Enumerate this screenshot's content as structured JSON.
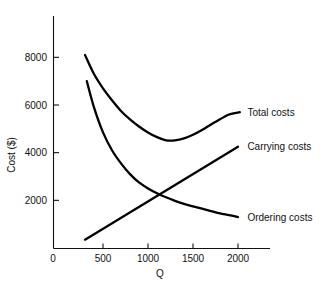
{
  "chart_data": {
    "type": "line",
    "title": "",
    "xlabel": "Q",
    "ylabel": "Cost ($)",
    "xlim": [
      0,
      2100
    ],
    "ylim": [
      0,
      9000
    ],
    "grid": false,
    "legend_position": "right-inline-labels",
    "x_ticks": [
      0,
      500,
      1000,
      1500,
      2000
    ],
    "x_tick_labels": [
      "0",
      "500",
      "1000",
      "1500",
      "2000"
    ],
    "y_ticks": [
      2000,
      4000,
      6000,
      8000
    ],
    "y_tick_labels": [
      "2000",
      "4000",
      "6000",
      "8000"
    ],
    "series": [
      {
        "name": "Total costs",
        "label": "Total costs",
        "x": [
          300,
          400,
          500,
          600,
          700,
          800,
          900,
          1000,
          1100,
          1200,
          1300,
          1400,
          1500,
          1600,
          1700,
          1800,
          1900,
          2020
        ],
        "values": [
          8100,
          7300,
          6700,
          6200,
          5750,
          5400,
          5100,
          4850,
          4650,
          4520,
          4520,
          4600,
          4750,
          4950,
          5180,
          5400,
          5600,
          5700
        ]
      },
      {
        "name": "Carrying costs",
        "label": "Carrying costs",
        "x": [
          300,
          2000
        ],
        "values": [
          350,
          4250
        ]
      },
      {
        "name": "Ordering costs",
        "label": "Ordering costs",
        "x": [
          320,
          400,
          500,
          600,
          700,
          800,
          900,
          1000,
          1100,
          1200,
          1300,
          1400,
          1500,
          1600,
          1700,
          1800,
          1900,
          2000
        ],
        "values": [
          7000,
          5900,
          4850,
          4100,
          3550,
          3100,
          2750,
          2500,
          2300,
          2130,
          1980,
          1850,
          1750,
          1650,
          1550,
          1450,
          1380,
          1300
        ]
      }
    ],
    "annotations": [
      {
        "text": "Total costs",
        "x": 2060,
        "y": 5700
      },
      {
        "text": "Carrying costs",
        "x": 2060,
        "y": 4250
      },
      {
        "text": "Ordering costs",
        "x": 2060,
        "y": 1300
      }
    ]
  }
}
